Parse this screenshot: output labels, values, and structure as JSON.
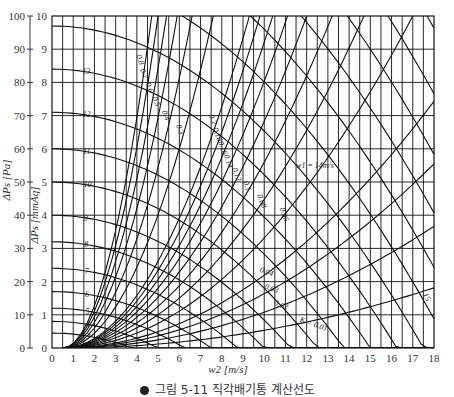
{
  "chart_data": {
    "type": "line",
    "title": "",
    "xlabel": "w2 [m/s]",
    "ylabel_left": "ΔPs [Pa]",
    "ylabel_right": "ΔPs [mmAq]",
    "xlim": [
      0,
      18
    ],
    "ylim_mmAq": [
      0,
      10
    ],
    "ylim_Pa": [
      0,
      100
    ],
    "x_ticks": [
      "0",
      "1",
      "2",
      "3",
      "4",
      "5",
      "6",
      "7",
      "8",
      "9",
      "10",
      "11",
      "12",
      "13",
      "14",
      "15",
      "16",
      "17",
      "18"
    ],
    "y_ticks_mmAq": [
      "0",
      "1",
      "2",
      "3",
      "4",
      "5",
      "6",
      "7",
      "8",
      "9",
      "10"
    ],
    "y_ticks_Pa": [
      "0",
      "10",
      "20",
      "30",
      "40",
      "50",
      "60",
      "70",
      "80",
      "90",
      "100"
    ],
    "grid": true,
    "grid_x_step": 0.5,
    "grid_y_step": 1,
    "w1_series": [
      {
        "name": "w1 = 14m/s",
        "label": "w1 = 14m/s",
        "w1": 14,
        "y0": 9.7
      },
      {
        "name": "13",
        "label": "13",
        "w1": 13,
        "y0": 8.4
      },
      {
        "name": "12",
        "label": "12",
        "w1": 12,
        "y0": 7.1
      },
      {
        "name": "11",
        "label": "11",
        "w1": 11,
        "y0": 6.0
      },
      {
        "name": "10",
        "label": "10",
        "w1": 10,
        "y0": 5.0
      },
      {
        "name": "9",
        "label": "9",
        "w1": 9,
        "y0": 4.0
      },
      {
        "name": "8",
        "label": "8",
        "w1": 8,
        "y0": 3.2
      },
      {
        "name": "7",
        "label": "7",
        "w1": 7,
        "y0": 2.4
      },
      {
        "name": "6",
        "label": "6",
        "w1": 6,
        "y0": 1.7
      },
      {
        "name": "5",
        "label": "5",
        "w1": 5,
        "y0": 1.2
      },
      {
        "name": "4",
        "label": "4",
        "w1": 4,
        "y0": 0.8
      },
      {
        "name": "3",
        "label": "3",
        "w1": 3,
        "y0": 0.45
      },
      {
        "name": "15",
        "label": "15",
        "w1": 15,
        "y0": 11.2
      },
      {
        "name": "16",
        "label": "16",
        "w1": 16,
        "y0": 12.8
      },
      {
        "name": "17",
        "label": "17",
        "w1": 17,
        "y0": 14.4
      },
      {
        "name": "18",
        "label": "18",
        "w1": 18,
        "y0": 16.2
      },
      {
        "name": "19",
        "label": "19",
        "w1": 19,
        "y0": 18.0
      },
      {
        "name": "w1 = 20m/s",
        "label": "w1 = 20m/s",
        "w1": 20,
        "y0": 20.0
      }
    ],
    "k_series": [
      {
        "name": "0.8",
        "label": "0.8",
        "K": 0.8,
        "x_at_top": 4.7
      },
      {
        "name": "0.7",
        "label": "0.7",
        "K": 0.7,
        "x_at_top": 5.0
      },
      {
        "name": "0.6",
        "label": "0.6",
        "K": 0.6,
        "x_at_top": 5.4
      },
      {
        "name": "0.5",
        "label": "0.5",
        "K": 0.5,
        "x_at_top": 5.9
      },
      {
        "name": "0.4",
        "label": "0.4",
        "K": 0.4,
        "x_at_top": 6.6
      },
      {
        "name": "0.3",
        "label": "0.3",
        "K": 0.3,
        "x_at_top": 7.6
      },
      {
        "name": "0.2",
        "label": "0.2",
        "K": 0.2,
        "x_at_top": 9.3
      },
      {
        "name": "0.18",
        "label": "0.18",
        "K": 0.18,
        "x_at_top": 9.8
      },
      {
        "name": "0.16",
        "label": "0.16",
        "K": 0.16,
        "x_at_top": 10.4
      },
      {
        "name": "0.14",
        "label": "0.14",
        "K": 0.14,
        "x_at_top": 11.1
      },
      {
        "name": "0.12",
        "label": "0.12",
        "K": 0.12,
        "x_at_top": 12.0
      },
      {
        "name": "0.1",
        "label": "0.1",
        "K": 0.1,
        "x_at_top": 13.2
      },
      {
        "name": "0.08",
        "label": "0.08",
        "K": 0.08,
        "x_at_top": 14.7
      },
      {
        "name": "0.06",
        "label": "0.06",
        "K": 0.06,
        "x_at_top": 17.0
      },
      {
        "name": "0.04",
        "label": "0.04",
        "K": 0.04,
        "x_at_top": 20.8
      },
      {
        "name": "0.03",
        "label": "0.03",
        "K": 0.03,
        "x_at_top": 24.0
      },
      {
        "name": "0.02",
        "label": "0.02",
        "K": 0.02,
        "x_at_top": 29.4
      },
      {
        "name": "K = 0.01",
        "label": "K = 0.01",
        "K": 0.01,
        "x_at_top": 41.6
      }
    ]
  },
  "axes": {
    "x_label": "w2 [m/s]",
    "y_left_label": "ΔPs [Pa]",
    "y_right_label": "ΔPs [mmAq]"
  },
  "caption": {
    "text": "그림 5-11  직각배기통 계산선도"
  }
}
